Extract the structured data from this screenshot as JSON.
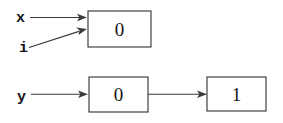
{
  "diagram": {
    "type": "pointer-box-diagram",
    "background_color": "#ffffff",
    "stroke_color": "#3a3a3a",
    "text_color": "#141414",
    "rows": [
      {
        "id": "row-top",
        "labels": [
          {
            "id": "label-x",
            "text": "x",
            "x": 16,
            "y": 22
          },
          {
            "id": "label-i",
            "text": "i",
            "x": 19,
            "y": 52
          }
        ],
        "boxes": [
          {
            "id": "box-top",
            "value": "0",
            "x": 88,
            "y": 11,
            "width": 63,
            "height": 36
          }
        ],
        "edges": [
          {
            "id": "edge-x-to-box-top",
            "from": "label-x",
            "to": "box-top",
            "style": "straight"
          },
          {
            "id": "edge-i-to-box-top",
            "from": "label-i",
            "to": "box-top",
            "style": "diagonal"
          }
        ]
      },
      {
        "id": "row-bottom",
        "labels": [
          {
            "id": "label-y",
            "text": "y",
            "x": 17,
            "y": 101
          }
        ],
        "boxes": [
          {
            "id": "box-bottom-left",
            "value": "0",
            "x": 89,
            "y": 77,
            "width": 59,
            "height": 35
          },
          {
            "id": "box-bottom-right",
            "value": "1",
            "x": 207,
            "y": 77,
            "width": 59,
            "height": 34
          }
        ],
        "edges": [
          {
            "id": "edge-y-to-box-bottom-left",
            "from": "label-y",
            "to": "box-bottom-left",
            "style": "straight"
          },
          {
            "id": "edge-box-bottom-left-to-right",
            "from": "box-bottom-left",
            "to": "box-bottom-right",
            "style": "straight"
          }
        ]
      }
    ]
  }
}
